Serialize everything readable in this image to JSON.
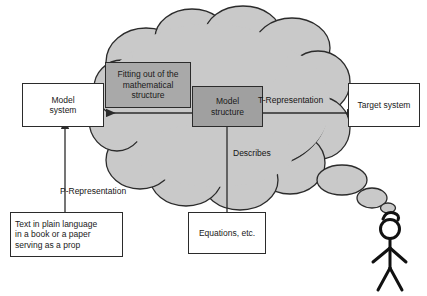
{
  "diagram": {
    "colors": {
      "cloud_fill": "#c9c9c9",
      "cloud_stroke": "#2b2b2b",
      "fitting_box_fill": "#a9a9a9",
      "model_structure_fill": "#a0a0a0",
      "plain_box_fill": "#ffffff",
      "line": "#2b2b2b",
      "text": "#151515"
    },
    "nodes": {
      "model_system": {
        "label_lines": [
          "Model",
          "system"
        ],
        "line1": "Model",
        "line2": "system"
      },
      "target_system": {
        "label_lines": [
          "Target system"
        ],
        "line1": "Target system"
      },
      "fitting_out": {
        "label_lines": [
          "Fitting out of the",
          "mathematical",
          "structure"
        ],
        "line1": "Fitting out of the",
        "line2": "mathematical",
        "line3": "structure"
      },
      "model_structure": {
        "label_lines": [
          "Model",
          "structure"
        ],
        "line1": "Model",
        "line2": "structure"
      },
      "plain_text_prop": {
        "label_lines": [
          "Text in plain language",
          "in a book or a paper",
          "serving as a prop"
        ],
        "line1": "Text in plain language",
        "line2": "in a book or a paper",
        "line3": "serving as a prop"
      },
      "equations": {
        "label_lines": [
          "Equations, etc."
        ],
        "line1": "Equations, etc."
      }
    },
    "edge_labels": {
      "t_representation": "T-Representation",
      "p_representation": "P-Representation",
      "describes": "Describes"
    },
    "figure": {
      "name": "thinking-person",
      "bubbles": 3
    }
  }
}
